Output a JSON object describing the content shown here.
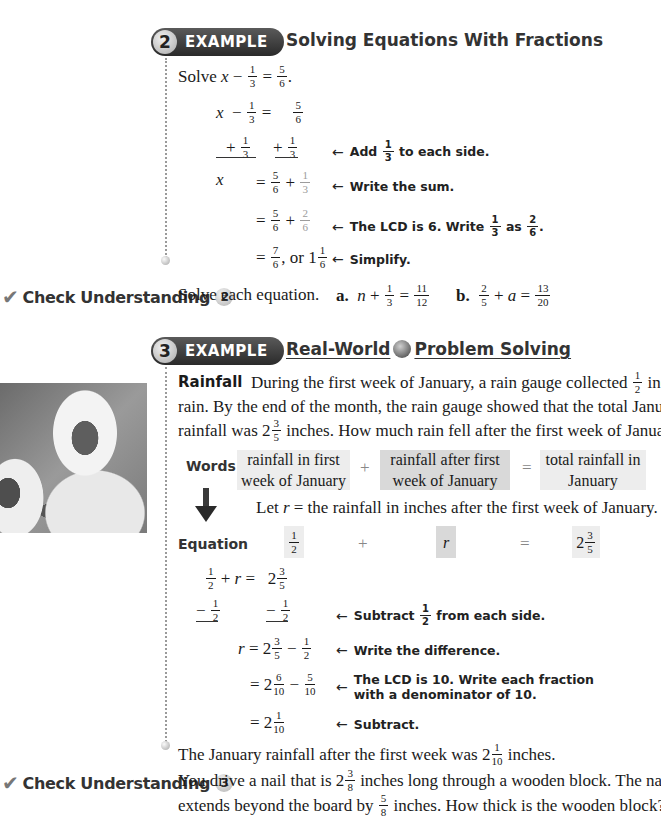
{
  "example2": {
    "number": "2",
    "badge_label": "EXAMPLE",
    "title": "Solving Equations With Fractions",
    "prompt": "Solve",
    "problem": {
      "lhs_var": "x",
      "op": "−",
      "frac1": {
        "n": "1",
        "d": "3"
      },
      "eq": "=",
      "rhs": {
        "n": "5",
        "d": "6"
      },
      "end": "."
    },
    "steps": [
      {
        "line": "x − 1/3 = 5/6"
      },
      {
        "line": "+ 1/3   + 1/3",
        "note": "Add 1/3 to each side."
      },
      {
        "line": "x = 5/6 + 1/3",
        "note": "Write the sum."
      },
      {
        "line": "= 5/6 + 2/6",
        "note": "The LCD is 6. Write 1/3 as 2/6."
      },
      {
        "line": "= 7/6, or 1 1/6",
        "note": "Simplify."
      }
    ],
    "notes": {
      "add_prefix": "Add",
      "add_suffix": "to each side.",
      "sum": "Write the sum.",
      "lcd_prefix": "The LCD is 6. Write",
      "lcd_mid": "as",
      "simplify": "Simplify."
    },
    "or_text": ", or 1"
  },
  "check2": {
    "label": "Check Understanding",
    "number": "2",
    "prompt": "Solve each equation.",
    "a": {
      "label": "a.",
      "var": "n",
      "frac": {
        "n": "1",
        "d": "3"
      },
      "rhs": {
        "n": "11",
        "d": "12"
      }
    },
    "b": {
      "label": "b.",
      "frac": {
        "n": "2",
        "d": "5"
      },
      "var": "a",
      "rhs": {
        "n": "13",
        "d": "20"
      }
    }
  },
  "example3": {
    "number": "3",
    "badge_label": "EXAMPLE",
    "title_part1": "Real-World",
    "title_part2": "Problem Solving",
    "globe_icon": "globe-icon",
    "lead": "Rainfall",
    "para_line1": "During the first week of January, a rain gauge collected",
    "para_line1_end": "inch of",
    "para_line2": "rain. By the end of the month, the rain gauge showed that the total January",
    "para_line3_start": "rainfall was 2",
    "para_line3_end": "inches. How much rain fell after the first week of January?",
    "words_label": "Words",
    "words": [
      "rainfall in first week of January",
      "rainfall after first week of January",
      "total rainfall in January"
    ],
    "words_ops": [
      "+",
      "="
    ],
    "let_text": "Let r = the rainfall in inches after the first week of January.",
    "let_prefix": "Let",
    "let_var": "r",
    "let_rest": "= the rainfall in inches after the first week of January.",
    "equation_label": "Equation",
    "eq_var": "r",
    "eq_whole": "2",
    "steps": [
      {
        "line": "1/2 + r = 2 3/5"
      },
      {
        "line": "− 1/2   − 1/2",
        "note": "Subtract 1/2 from each side."
      },
      {
        "line": "r = 2 3/5 − 1/2",
        "note": "Write the difference."
      },
      {
        "line": "= 2 6/10 − 5/10",
        "note": "The LCD is 10. Write each fraction with a denominator of 10."
      },
      {
        "line": "= 2 1/10",
        "note": "Subtract."
      }
    ],
    "notes": {
      "sub_prefix": "Subtract",
      "sub_suffix": "from each side.",
      "diff": "Write the difference.",
      "lcd_line1": "The LCD is 10. Write each fraction",
      "lcd_line2": "with a denominator of 10.",
      "subtract": "Subtract."
    },
    "conclusion_start": "The January rainfall after the first week was 2",
    "conclusion_end": "inches."
  },
  "check3": {
    "label": "Check Understanding",
    "number": "3",
    "line1_start": "You drive a nail that is 2",
    "line1_end": "inches long through a wooden block. The nail",
    "line2_start": "extends beyond the board by",
    "line2_end": "inches. How thick is the wooden block?"
  },
  "icons": {
    "check": "✔",
    "arrow_left": "←"
  }
}
